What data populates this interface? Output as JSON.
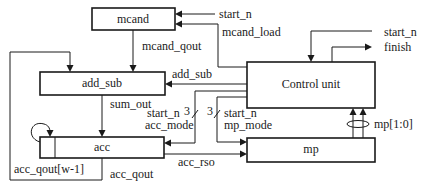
{
  "diagram": {
    "blocks": {
      "mcand": "mcand",
      "add_sub": "add_sub",
      "control_unit": "Control unit",
      "acc": "acc",
      "mp": "mp"
    },
    "signals": {
      "start_n_mcand": "start_n",
      "mcand_load": "mcand_load",
      "mcand_qout": "mcand_qout",
      "add_sub": "add_sub",
      "start_n_ctrl": "start_n",
      "finish": "finish",
      "sum_out": "sum_out",
      "bus_width_acc": "3",
      "bus_width_mp": "3",
      "start_n_acc": "start_n",
      "acc_mode": "acc_mode",
      "start_n_mp": "start_n",
      "mp_mode": "mp_mode",
      "mp_bits": "mp[1:0]",
      "acc_rso": "acc_rso",
      "acc_qout_msb": "acc_qout[w-1]",
      "acc_qout": "acc_qout"
    },
    "colors": {
      "line": "#1a1a1a",
      "background": "#ffffff"
    }
  }
}
